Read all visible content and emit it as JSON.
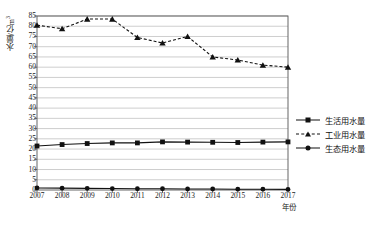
{
  "chart_data": {
    "type": "line",
    "title": "",
    "xlabel": "年份",
    "ylabel": "水量/亿m³",
    "categories": [
      "2007",
      "2008",
      "2009",
      "2010",
      "2011",
      "2012",
      "2013",
      "2014",
      "2015",
      "2016",
      "2017"
    ],
    "ylim": [
      0,
      85
    ],
    "yticks": [
      0,
      5,
      10,
      15,
      20,
      25,
      30,
      35,
      40,
      45,
      50,
      55,
      60,
      65,
      70,
      75,
      80,
      85
    ],
    "grid": true,
    "legend_position": "right",
    "series": [
      {
        "name": "生活用水量",
        "marker": "square",
        "linestyle": "solid",
        "color": "#111111",
        "values": [
          21.5,
          22.2,
          22.7,
          23.0,
          23.0,
          23.5,
          23.4,
          23.3,
          23.2,
          23.4,
          23.5
        ]
      },
      {
        "name": "工业用水量",
        "marker": "triangle",
        "linestyle": "dashed",
        "color": "#111111",
        "values": [
          80.5,
          78.8,
          83.5,
          83.5,
          74.5,
          71.8,
          75.0,
          65.0,
          63.5,
          61.0,
          60.0
        ]
      },
      {
        "name": "生态用水量",
        "marker": "circle",
        "linestyle": "solid",
        "color": "#111111",
        "values": [
          1.0,
          0.9,
          0.8,
          0.7,
          0.6,
          0.6,
          0.5,
          0.5,
          0.4,
          0.4,
          0.3
        ]
      }
    ]
  },
  "legend": {
    "items": [
      {
        "label": "生活用水量",
        "marker": "square",
        "dashed": false
      },
      {
        "label": "工业用水量",
        "marker": "triangle",
        "dashed": true
      },
      {
        "label": "生态用水量",
        "marker": "circle",
        "dashed": false
      }
    ]
  },
  "axes": {
    "y_title": "水量/亿m³",
    "x_title": "年份"
  }
}
